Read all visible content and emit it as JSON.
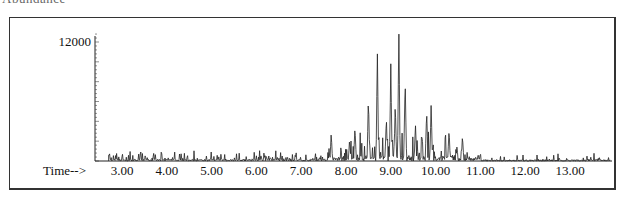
{
  "header": {
    "clipped_title": "Abundance"
  },
  "chart": {
    "y_label_top": "12000",
    "x_axis_prefix": "Time-->",
    "x_ticks": [
      "3.00",
      "4.00",
      "5.00",
      "6.00",
      "7.00",
      "8.00",
      "9.00",
      "10.00",
      "11.00",
      "12.00",
      "13.00"
    ]
  },
  "chart_data": {
    "type": "line",
    "title": "",
    "ylabel": "Abundance",
    "xlabel": "Time-->",
    "xlim": [
      2.7,
      13.9
    ],
    "ylim": [
      0,
      13000
    ],
    "y_ticks_labeled": [
      12000
    ],
    "x_ticks": [
      3,
      4,
      5,
      6,
      7,
      8,
      9,
      10,
      11,
      12,
      13
    ],
    "grid": false,
    "legend": null,
    "major_peaks": [
      {
        "time": 7.67,
        "abundance": 2800
      },
      {
        "time": 8.08,
        "abundance": 2200
      },
      {
        "time": 8.2,
        "abundance": 3500
      },
      {
        "time": 8.5,
        "abundance": 6400
      },
      {
        "time": 8.7,
        "abundance": 10800
      },
      {
        "time": 8.9,
        "abundance": 4500
      },
      {
        "time": 9.0,
        "abundance": 9800
      },
      {
        "time": 9.1,
        "abundance": 6000
      },
      {
        "time": 9.18,
        "abundance": 12800
      },
      {
        "time": 9.32,
        "abundance": 8400
      },
      {
        "time": 9.55,
        "abundance": 3800
      },
      {
        "time": 9.8,
        "abundance": 5200
      },
      {
        "time": 9.9,
        "abundance": 5600
      },
      {
        "time": 10.3,
        "abundance": 3200
      },
      {
        "time": 10.6,
        "abundance": 2600
      }
    ]
  }
}
